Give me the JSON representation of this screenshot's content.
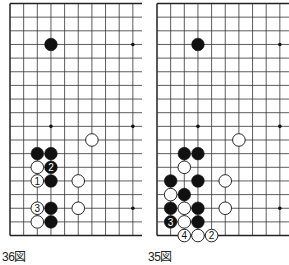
{
  "diagrams": [
    {
      "id": "left",
      "caption": "36図",
      "offset_x": 10,
      "stones": [
        {
          "c": 3,
          "r": 3,
          "color": "black"
        },
        {
          "c": 6,
          "r": 10,
          "color": "white"
        },
        {
          "c": 2,
          "r": 11,
          "color": "black"
        },
        {
          "c": 3,
          "r": 11,
          "color": "black"
        },
        {
          "c": 2,
          "r": 12,
          "color": "white"
        },
        {
          "c": 3,
          "r": 12,
          "color": "black",
          "label": "2"
        },
        {
          "c": 2,
          "r": 13,
          "color": "white",
          "label": "1"
        },
        {
          "c": 3,
          "r": 13,
          "color": "black"
        },
        {
          "c": 5,
          "r": 13,
          "color": "white"
        },
        {
          "c": 2,
          "r": 15,
          "color": "white",
          "label": "3"
        },
        {
          "c": 3,
          "r": 15,
          "color": "black"
        },
        {
          "c": 5,
          "r": 15,
          "color": "white"
        },
        {
          "c": 2,
          "r": 16,
          "color": "white"
        },
        {
          "c": 3,
          "r": 16,
          "color": "black"
        }
      ]
    },
    {
      "id": "right",
      "caption": "35図",
      "offset_x": 157,
      "stones": [
        {
          "c": 3,
          "r": 3,
          "color": "black"
        },
        {
          "c": 6,
          "r": 10,
          "color": "white"
        },
        {
          "c": 2,
          "r": 11,
          "color": "black"
        },
        {
          "c": 3,
          "r": 11,
          "color": "black"
        },
        {
          "c": 2,
          "r": 12,
          "color": "white"
        },
        {
          "c": 1,
          "r": 13,
          "color": "black"
        },
        {
          "c": 3,
          "r": 13,
          "color": "black"
        },
        {
          "c": 5,
          "r": 13,
          "color": "white"
        },
        {
          "c": 1,
          "r": 14,
          "color": "white"
        },
        {
          "c": 2,
          "r": 14,
          "color": "black"
        },
        {
          "c": 1,
          "r": 15,
          "color": "black"
        },
        {
          "c": 2,
          "r": 15,
          "color": "white"
        },
        {
          "c": 3,
          "r": 15,
          "color": "black"
        },
        {
          "c": 5,
          "r": 15,
          "color": "white"
        },
        {
          "c": 1,
          "r": 16,
          "color": "black",
          "label": "3"
        },
        {
          "c": 2,
          "r": 16,
          "color": "white"
        },
        {
          "c": 3,
          "r": 16,
          "color": "black"
        },
        {
          "c": 2,
          "r": 17,
          "color": "white",
          "label": "4"
        },
        {
          "c": 3,
          "r": 17,
          "color": "white"
        },
        {
          "c": 4,
          "r": 17,
          "color": "white",
          "label": "2"
        }
      ]
    }
  ],
  "grid": {
    "spacing": 13.65,
    "top": 3.5,
    "cols_visible": 10,
    "rows": 18,
    "star_points": [
      [
        3,
        3
      ],
      [
        9,
        3
      ],
      [
        3,
        9
      ],
      [
        9,
        9
      ],
      [
        3,
        15
      ],
      [
        9,
        15
      ]
    ],
    "line_color": "#333333",
    "edge_color": "#222222"
  }
}
